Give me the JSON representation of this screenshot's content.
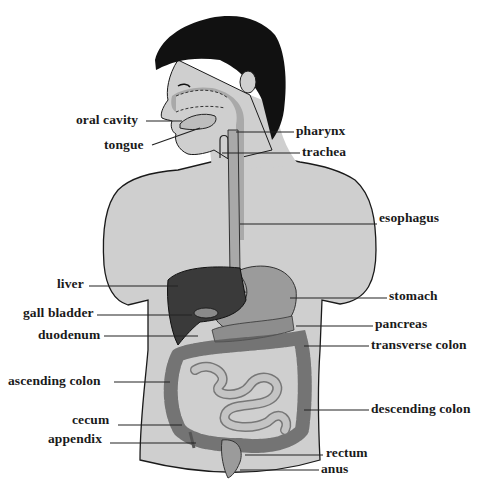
{
  "diagram": {
    "colors": {
      "background": "#ffffff",
      "skin": "#cfcfcf",
      "hair": "#111111",
      "tract": "#a9a9a9",
      "liver": "#3a3a3a",
      "outline": "#1a1a1a",
      "text": "#1a1a1a"
    },
    "labels": [
      {
        "id": "oral-cavity",
        "text": "oral cavity",
        "x": 76,
        "y": 113,
        "side": "left",
        "line": [
          146,
          121,
          182,
          121
        ]
      },
      {
        "id": "tongue",
        "text": "tongue",
        "x": 104,
        "y": 138,
        "side": "left",
        "line": [
          152,
          145,
          200,
          128
        ]
      },
      {
        "id": "pharynx",
        "text": "pharynx",
        "x": 296,
        "y": 124,
        "side": "right",
        "line": [
          236,
          132,
          294,
          132
        ]
      },
      {
        "id": "trachea",
        "text": "trachea",
        "x": 302,
        "y": 145,
        "side": "right",
        "line": [
          222,
          153,
          300,
          153
        ]
      },
      {
        "id": "esophagus",
        "text": "esophagus",
        "x": 379,
        "y": 211,
        "side": "right",
        "line": [
          240,
          224,
          377,
          224
        ]
      },
      {
        "id": "liver",
        "text": "liver",
        "x": 57,
        "y": 277,
        "side": "left",
        "line": [
          89,
          286,
          178,
          286
        ]
      },
      {
        "id": "stomach",
        "text": "stomach",
        "x": 389,
        "y": 289,
        "side": "right",
        "line": [
          290,
          298,
          387,
          298
        ]
      },
      {
        "id": "gall-bladder",
        "text": "gall bladder",
        "x": 23,
        "y": 306,
        "side": "left",
        "line": [
          97,
          315,
          192,
          315
        ]
      },
      {
        "id": "pancreas",
        "text": "pancreas",
        "x": 375,
        "y": 317,
        "side": "right",
        "line": [
          296,
          326,
          373,
          326
        ]
      },
      {
        "id": "duodenum",
        "text": "duodenum",
        "x": 38,
        "y": 328,
        "side": "left",
        "line": [
          104,
          336,
          198,
          336
        ]
      },
      {
        "id": "transverse-colon",
        "text": "transverse colon",
        "x": 371,
        "y": 338,
        "side": "right",
        "line": [
          304,
          346,
          369,
          346
        ]
      },
      {
        "id": "ascending-colon",
        "text": "ascending colon",
        "x": 8,
        "y": 374,
        "side": "left",
        "line": [
          114,
          382,
          170,
          382
        ]
      },
      {
        "id": "cecum",
        "text": "cecum",
        "x": 72,
        "y": 413,
        "side": "left",
        "line": [
          118,
          425,
          182,
          425
        ]
      },
      {
        "id": "descending-colon",
        "text": "descending colon",
        "x": 371,
        "y": 402,
        "side": "right",
        "line": [
          304,
          410,
          369,
          410
        ]
      },
      {
        "id": "appendix",
        "text": "appendix",
        "x": 48,
        "y": 432,
        "side": "left",
        "line": [
          110,
          443,
          196,
          443
        ]
      },
      {
        "id": "rectum",
        "text": "rectum",
        "x": 326,
        "y": 446,
        "side": "right",
        "line": [
          245,
          455,
          323,
          455
        ]
      },
      {
        "id": "anus",
        "text": "anus",
        "x": 321,
        "y": 462,
        "side": "right",
        "line": [
          240,
          470,
          319,
          470
        ]
      }
    ]
  }
}
